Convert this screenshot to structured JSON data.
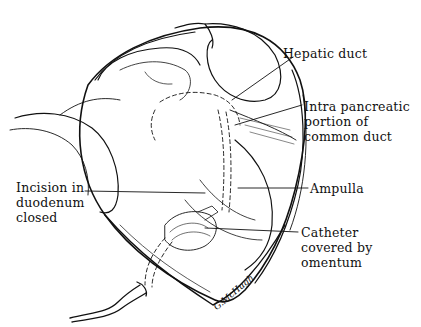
{
  "figure": {
    "type": "surgical illustration",
    "labels": {
      "hepatic_duct": "Hepatic duct",
      "intrapancreatic": "Intra pancreatic\nportion of\ncommon duct",
      "ampulla": "Ampulla",
      "incision": "Incision in\nduodenum\nclosed",
      "catheter": "Catheter\ncovered by\nomentum"
    },
    "signature": "G.McHugh"
  }
}
